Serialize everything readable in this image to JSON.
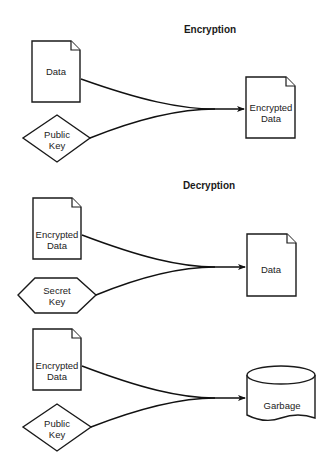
{
  "colors": {
    "stroke": "#1a1a1a",
    "background": "#ffffff",
    "text": "#222222"
  },
  "sections": [
    {
      "heading": "Encryption",
      "inputs": [
        {
          "shape": "document",
          "label": "Data"
        },
        {
          "shape": "diamond",
          "label": "Public\nKey"
        }
      ],
      "output": {
        "shape": "document",
        "label": "Encrypted\nData"
      }
    },
    {
      "heading": "Decryption",
      "inputs": [
        {
          "shape": "document",
          "label": "Encrypted\nData"
        },
        {
          "shape": "hexagon",
          "label": "Secret\nKey"
        }
      ],
      "output": {
        "shape": "document",
        "label": "Data"
      }
    },
    {
      "heading": "",
      "inputs": [
        {
          "shape": "document",
          "label": "Encrypted\nData"
        },
        {
          "shape": "diamond",
          "label": "Public\nKey"
        }
      ],
      "output": {
        "shape": "cylinder",
        "label": "Garbage"
      }
    }
  ]
}
